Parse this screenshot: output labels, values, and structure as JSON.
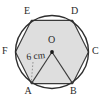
{
  "figure": {
    "shapes": {
      "circle_name": "circumcircle",
      "polygon_name": "regular-hexagon",
      "triangle_name": "triangle-oab"
    },
    "colors": {
      "hexagon_fill": "#dedede",
      "stroke": "#3a3a3a",
      "circle_stroke": "#2e2e2e",
      "label_text": "#2a2a2a",
      "background": "#ffffff",
      "leader_line": "#8a8a8a"
    },
    "center": {
      "label": "O",
      "dot_name": "center-point"
    },
    "vertices": [
      {
        "label": "A",
        "position": "bottom-left"
      },
      {
        "label": "B",
        "position": "bottom-right"
      },
      {
        "label": "C",
        "position": "right"
      },
      {
        "label": "D",
        "position": "top-right"
      },
      {
        "label": "E",
        "position": "top-left"
      },
      {
        "label": "F",
        "position": "left"
      }
    ],
    "dimension": {
      "value": "6 cm",
      "measures": "radius-OA",
      "leader_target": "A"
    },
    "geometry": {
      "circle_cx": 52,
      "circle_cy": 52,
      "circle_r": 36.5,
      "hex_r": 36.5,
      "hex_points": "52,88.5 83.6,70.25 83.6,33.75 52,15.5 20.4,33.75 20.4,70.25"
    }
  }
}
